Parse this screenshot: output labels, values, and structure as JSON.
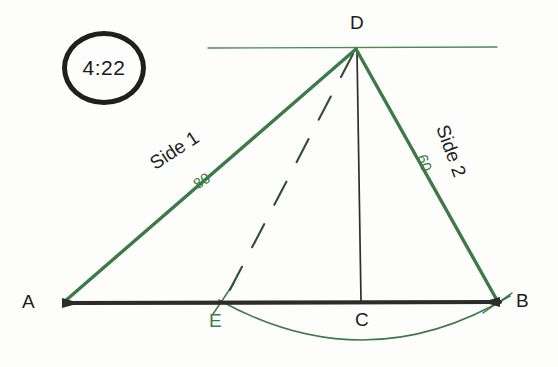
{
  "badge": {
    "time": "4:22",
    "icon": "circle-badge-icon"
  },
  "figure": {
    "vertices": [
      {
        "id": "A",
        "label": "A",
        "color": "#1c1c1c",
        "x": 64,
        "y": 303,
        "label_x": 22,
        "label_y": 291
      },
      {
        "id": "B",
        "label": "B",
        "color": "#1c1c1c",
        "x": 498,
        "y": 302,
        "label_x": 516,
        "label_y": 290
      },
      {
        "id": "C",
        "label": "C",
        "color": "#1c1c1c",
        "x": 362,
        "y": 302,
        "label_x": 355,
        "label_y": 309
      },
      {
        "id": "D",
        "label": "D",
        "color": "#1c1c1c",
        "x": 356,
        "y": 48,
        "label_x": 350,
        "label_y": 12
      },
      {
        "id": "E",
        "label": "E",
        "color": "#3d7a48",
        "x": 222,
        "y": 302,
        "label_x": 209,
        "label_y": 310
      }
    ],
    "side_labels": [
      {
        "name": "side-1",
        "text": "Side 1",
        "length": "80",
        "color": "#242424",
        "length_color": "#3d7a48",
        "x": 146,
        "y": 156,
        "rotate": -33,
        "len_x": 190,
        "len_y": 178,
        "len_rotate": -33
      },
      {
        "name": "side-2",
        "text": "Side 2",
        "length": "60",
        "color": "#242424",
        "length_color": "#3d7a48",
        "x": 452,
        "y": 122,
        "rotate": 70,
        "len_x": 430,
        "len_y": 152,
        "len_rotate": 70
      }
    ],
    "strokes": {
      "baseline_color": "#2e2c2b",
      "baseline_width": 4,
      "side_color": "#3d7a48",
      "side_width": 3.4,
      "altitude_color": "#2f2e2d",
      "altitude_width": 1.7,
      "dashed_color": "#2f4f35",
      "dashed_width": 2.1,
      "arc_color": "#3d7a48",
      "arc_width": 1.6,
      "hline_color": "#4c8a58",
      "hline_width": 1.4
    },
    "geometry": {
      "baseline": {
        "x1": 64,
        "y1": 303,
        "x2": 500,
        "y2": 302
      },
      "side_ad": {
        "x1": 64,
        "y1": 302,
        "x2": 356,
        "y2": 49
      },
      "side_db": {
        "x1": 356,
        "y1": 49,
        "x2": 498,
        "y2": 302
      },
      "altitude": {
        "x1": 357,
        "y1": 52,
        "x2": 361,
        "y2": 301
      },
      "dashed_de": {
        "x1": 353,
        "y1": 54,
        "x2": 222,
        "y2": 305
      },
      "horizontal_through_d": {
        "x1": 208,
        "y1": 48,
        "x2": 497,
        "y2": 47
      },
      "arc_eb": {
        "start_x": 219,
        "start_y": 300,
        "end_x": 510,
        "end_y": 296,
        "ctrl_x": 366,
        "ctrl_y": 382
      },
      "tick_at_e": {
        "x1": 234,
        "y1": 283,
        "x2": 213,
        "y2": 314
      },
      "tick_at_b": {
        "x1": 483,
        "y1": 313,
        "x2": 512,
        "y2": 293
      }
    }
  }
}
